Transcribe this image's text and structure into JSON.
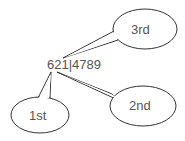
{
  "diagram": {
    "center_text": "621|4789",
    "callouts": [
      {
        "label": "3rd"
      },
      {
        "label": "1st"
      },
      {
        "label": "2nd"
      }
    ],
    "colors": {
      "stroke": "#333333",
      "text": "#555555",
      "fill": "#ffffff"
    }
  }
}
